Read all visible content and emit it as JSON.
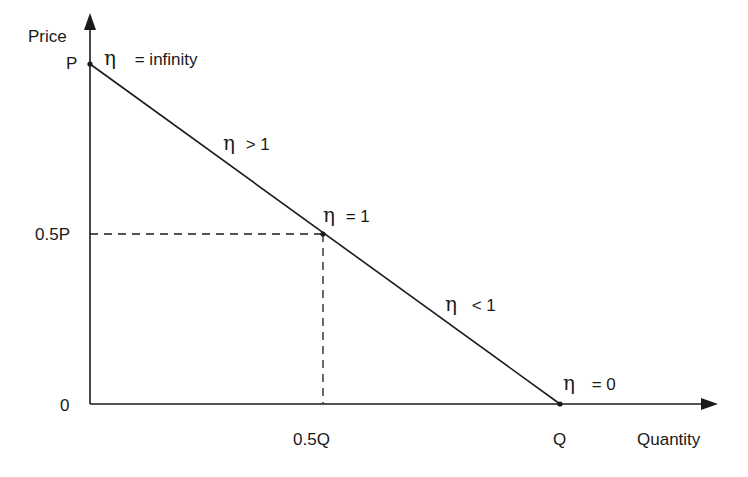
{
  "diagram": {
    "y_axis_label": "Price",
    "x_axis_label": "Quantity",
    "y_ticks": {
      "top": "P",
      "mid": "0.5P",
      "origin": "0"
    },
    "x_ticks": {
      "mid": "0.5Q",
      "end": "Q"
    },
    "eta_symbol": "η",
    "annotations": {
      "at_p": "= infinity",
      "upper_segment": "> 1",
      "midpoint": "= 1",
      "lower_segment": "< 1",
      "at_q": "= 0"
    },
    "colors": {
      "line": "#1a1a1a",
      "background": "#ffffff"
    }
  }
}
